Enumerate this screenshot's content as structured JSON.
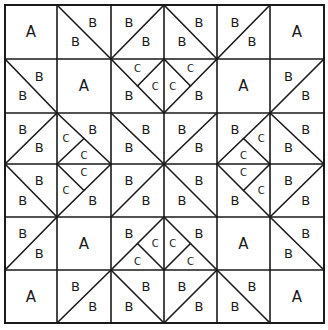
{
  "diagram": {
    "type": "quilt-block-piecing-diagram",
    "grid": {
      "rows": 6,
      "cols": 6
    },
    "line_color": "#1a1a1a",
    "background": "#ffffff",
    "piece_types": [
      "A",
      "B",
      "C"
    ],
    "legend_note": "Cell codes: A = plain square; '\\\\' = diagonal top-left to bottom-right; '/' = diagonal bottom-left to top-right; split_corner = corner from which a line runs to the diagonal midpoint creating two C triangles",
    "cells": [
      [
        {
          "kind": "A",
          "labels": [
            "A"
          ]
        },
        {
          "kind": "diag",
          "dir": "\\",
          "labels": [
            "B",
            "B"
          ]
        },
        {
          "kind": "diag",
          "dir": "/",
          "labels": [
            "B",
            "B"
          ]
        },
        {
          "kind": "diag",
          "dir": "\\",
          "labels": [
            "B",
            "B"
          ]
        },
        {
          "kind": "diag",
          "dir": "/",
          "labels": [
            "B",
            "B"
          ]
        },
        {
          "kind": "A",
          "labels": [
            "A"
          ]
        }
      ],
      [
        {
          "kind": "diag",
          "dir": "\\",
          "labels": [
            "B",
            "B"
          ]
        },
        {
          "kind": "A",
          "labels": [
            "A"
          ]
        },
        {
          "kind": "split",
          "dir": "\\",
          "split_corner": "TR",
          "labels": [
            "B",
            "C",
            "C"
          ]
        },
        {
          "kind": "split",
          "dir": "/",
          "split_corner": "TL",
          "labels": [
            "B",
            "C",
            "C"
          ]
        },
        {
          "kind": "A",
          "labels": [
            "A"
          ]
        },
        {
          "kind": "diag",
          "dir": "/",
          "labels": [
            "B",
            "B"
          ]
        }
      ],
      [
        {
          "kind": "diag",
          "dir": "/",
          "labels": [
            "B",
            "B"
          ]
        },
        {
          "kind": "split",
          "dir": "\\",
          "split_corner": "BL",
          "labels": [
            "B",
            "C",
            "C"
          ]
        },
        {
          "kind": "diag",
          "dir": "\\",
          "labels": [
            "B",
            "B"
          ]
        },
        {
          "kind": "diag",
          "dir": "/",
          "labels": [
            "B",
            "B"
          ]
        },
        {
          "kind": "split",
          "dir": "/",
          "split_corner": "BR",
          "labels": [
            "B",
            "C",
            "C"
          ]
        },
        {
          "kind": "diag",
          "dir": "\\",
          "labels": [
            "B",
            "B"
          ]
        }
      ],
      [
        {
          "kind": "diag",
          "dir": "\\",
          "labels": [
            "B",
            "B"
          ]
        },
        {
          "kind": "split",
          "dir": "/",
          "split_corner": "TL",
          "labels": [
            "B",
            "C",
            "C"
          ]
        },
        {
          "kind": "diag",
          "dir": "/",
          "labels": [
            "B",
            "B"
          ]
        },
        {
          "kind": "diag",
          "dir": "\\",
          "labels": [
            "B",
            "B"
          ]
        },
        {
          "kind": "split",
          "dir": "\\",
          "split_corner": "TR",
          "labels": [
            "B",
            "C",
            "C"
          ]
        },
        {
          "kind": "diag",
          "dir": "/",
          "labels": [
            "B",
            "B"
          ]
        }
      ],
      [
        {
          "kind": "diag",
          "dir": "/",
          "labels": [
            "B",
            "B"
          ]
        },
        {
          "kind": "A",
          "labels": [
            "A"
          ]
        },
        {
          "kind": "split",
          "dir": "/",
          "split_corner": "BR",
          "labels": [
            "B",
            "C",
            "C"
          ]
        },
        {
          "kind": "split",
          "dir": "\\",
          "split_corner": "BL",
          "labels": [
            "B",
            "C",
            "C"
          ]
        },
        {
          "kind": "A",
          "labels": [
            "A"
          ]
        },
        {
          "kind": "diag",
          "dir": "\\",
          "labels": [
            "B",
            "B"
          ]
        }
      ],
      [
        {
          "kind": "A",
          "labels": [
            "A"
          ]
        },
        {
          "kind": "diag",
          "dir": "/",
          "labels": [
            "B",
            "B"
          ]
        },
        {
          "kind": "diag",
          "dir": "\\",
          "labels": [
            "B",
            "B"
          ]
        },
        {
          "kind": "diag",
          "dir": "/",
          "labels": [
            "B",
            "B"
          ]
        },
        {
          "kind": "diag",
          "dir": "\\",
          "labels": [
            "B",
            "B"
          ]
        },
        {
          "kind": "A",
          "labels": [
            "A"
          ]
        }
      ]
    ]
  }
}
